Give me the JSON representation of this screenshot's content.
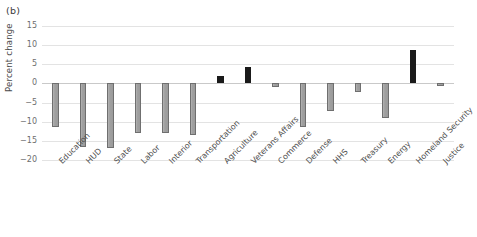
{
  "figure": {
    "panel_label": "(b)"
  },
  "chart_data": {
    "type": "bar",
    "title": "",
    "subtitle": "",
    "xlabel": "",
    "ylabel": "Percent change",
    "ylim": [
      -20,
      15
    ],
    "yticks": [
      15,
      10,
      5,
      0,
      -5,
      -10,
      -15,
      -20
    ],
    "ytick_labels": [
      "15",
      "10",
      "5",
      "0",
      "−5",
      "−10",
      "−15",
      "−20"
    ],
    "grid": true,
    "legend": "none",
    "categories": [
      "Education",
      "HUD",
      "State",
      "Labor",
      "Interior",
      "Transportation",
      "Agriculture",
      "Veterans Affairs",
      "Commerce",
      "Defense",
      "HHS",
      "Treasury",
      "Energy",
      "Homeland Security",
      "Justice"
    ],
    "values": [
      -11.5,
      -16.5,
      -16.8,
      -13.0,
      -13.0,
      -13.5,
      2.0,
      4.3,
      -1.0,
      -11.5,
      -7.3,
      -2.3,
      -9.0,
      8.7,
      -0.8
    ],
    "bar_colors": [
      "#9b9b9b",
      "#9b9b9b",
      "#9b9b9b",
      "#9b9b9b",
      "#9b9b9b",
      "#9b9b9b",
      "#1a1a1a",
      "#1a1a1a",
      "#9b9b9b",
      "#9b9b9b",
      "#9b9b9b",
      "#9b9b9b",
      "#9b9b9b",
      "#1a1a1a",
      "#9b9b9b"
    ]
  },
  "colors": {
    "negative_bar": "#9b9b9b",
    "positive_bar": "#1a1a1a",
    "gridline": "#e3e3e3",
    "zero_line": "#c9c9c9",
    "tick_text": "#6e6e6e",
    "label_text": "#4f4f4f"
  }
}
